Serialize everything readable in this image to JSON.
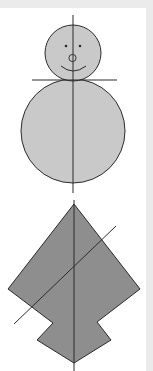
{
  "figures": [
    {
      "name": "snowman",
      "description": "Snowman with a vertical line of symmetry and a horizontal line at the neck",
      "fill_color": "#c9c9c9",
      "stroke_color": "#2b2b2b",
      "symmetry_lines": [
        "vertical",
        "horizontal"
      ]
    },
    {
      "name": "arrow-kite-shape",
      "description": "Kite-like arrowhead polygon with a vertical line of symmetry and a diagonal line",
      "fill_color": "#8e8e8e",
      "stroke_color": "#2b2b2b",
      "symmetry_lines": [
        "vertical",
        "diagonal"
      ]
    }
  ],
  "colors": {
    "background": "#ffffff",
    "frame": "#ebebeb"
  }
}
